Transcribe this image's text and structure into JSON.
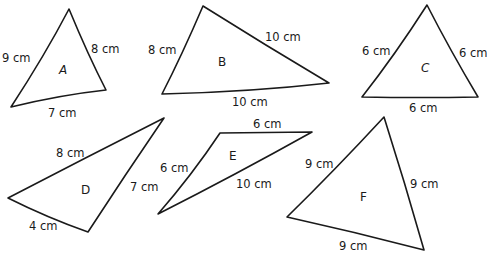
{
  "triangles": [
    {
      "name": "A",
      "sides": [
        "9 cm",
        "8 cm",
        "7 cm"
      ]
    },
    {
      "name": "B",
      "sides": [
        "8 cm",
        "10 cm",
        "10 cm"
      ]
    },
    {
      "name": "C",
      "sides": [
        "6 cm",
        "6 cm",
        "6 cm"
      ]
    },
    {
      "name": "D",
      "sides": [
        "8 cm",
        "7 cm",
        "4 cm"
      ]
    },
    {
      "name": "E",
      "sides": [
        "6 cm",
        "6 cm",
        "10 cm"
      ]
    },
    {
      "name": "F",
      "sides": [
        "9 cm",
        "9 cm",
        "9 cm"
      ]
    }
  ]
}
